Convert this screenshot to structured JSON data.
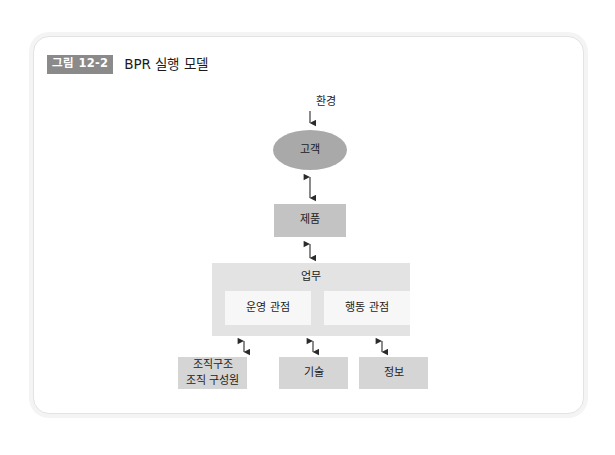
{
  "figure": {
    "badge": "그림 12-2",
    "title": "BPR 실행 모델"
  },
  "colors": {
    "page_background": "#ffffff",
    "frame_border": "#e3e3e3",
    "frame_shadow": "#f4f4f4",
    "badge_background": "#8a8a8a",
    "badge_text": "#ffffff",
    "ellipse_fill": "#a9a9a9",
    "product_fill": "#c3c3c3",
    "work_fill": "#e3e3e3",
    "work_sub_fill": "#f7f7f7",
    "bottom_fill": "#d5d5d5",
    "arrow": "#2b2b2b",
    "text": "#1c1c1c"
  },
  "diagram": {
    "environment_label": "환경",
    "customer": "고객",
    "product": "제품",
    "work": {
      "label": "업무",
      "perspectives": [
        {
          "label": "운영 관점"
        },
        {
          "label": "행동 관점"
        }
      ]
    },
    "resources": [
      {
        "line1": "조직구조",
        "line2": "조직 구성원"
      },
      {
        "line1": "기술",
        "line2": ""
      },
      {
        "line1": "정보",
        "line2": ""
      }
    ]
  }
}
